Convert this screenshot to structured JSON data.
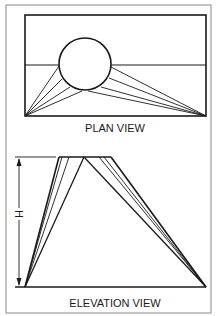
{
  "plan_view": {
    "caption": "PLAN VIEW",
    "rect": {
      "x1": 25,
      "y1": 15,
      "x2": 206,
      "y2": 116
    },
    "midline_y": 65,
    "circle": {
      "cx": 85,
      "cy": 64,
      "r": 26
    },
    "left_vertex": [
      25,
      116
    ],
    "right_vertex": [
      206,
      116
    ],
    "left_tangent_points": [
      [
        59,
        66
      ],
      [
        62,
        78
      ],
      [
        70,
        87
      ],
      [
        82,
        91
      ]
    ],
    "right_tangent_points": [
      [
        111,
        67
      ],
      [
        109,
        78
      ],
      [
        101,
        87
      ],
      [
        88,
        91
      ]
    ]
  },
  "elevation_view": {
    "caption": "ELEVATION VIEW",
    "dimension_label": "H",
    "top_y": 157,
    "base_y": 287,
    "base_x1": 25,
    "base_x2": 206,
    "top_points_left": [
      59,
      62,
      69,
      84
    ],
    "top_points_right": [
      84,
      99,
      104,
      111
    ]
  },
  "colors": {
    "line": "#1a1a1a",
    "frame": "#888888",
    "background": "#ffffff"
  }
}
